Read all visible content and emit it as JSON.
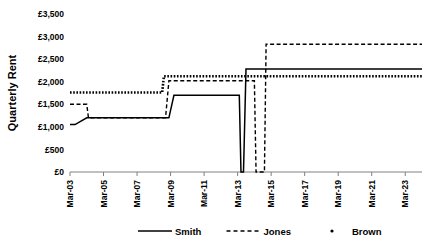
{
  "chart_data": {
    "type": "line",
    "title": "",
    "xlabel": "",
    "ylabel": "Quarterly Rent",
    "ylim": [
      0,
      3500
    ],
    "ytick_values": [
      0,
      500,
      1000,
      1500,
      2000,
      2500,
      3000,
      3500
    ],
    "ytick_labels": [
      "£0",
      "£500",
      "£1,000",
      "£1,500",
      "£2,000",
      "£2,500",
      "£3,000",
      "£3,500"
    ],
    "xlim": [
      2003,
      2024
    ],
    "xtick_values": [
      2003,
      2005,
      2007,
      2009,
      2011,
      2013,
      2015,
      2017,
      2019,
      2021,
      2023
    ],
    "xtick_labels": [
      "Mar-03",
      "Mar-05",
      "Mar-07",
      "Mar-09",
      "Mar-11",
      "Mar-13",
      "Mar-15",
      "Mar-17",
      "Mar-19",
      "Mar-21",
      "Mar-23"
    ],
    "grid": false,
    "legend_position": "bottom",
    "series": [
      {
        "name": "Smith",
        "style": "solid",
        "color": "#000000",
        "x": [
          2003.0,
          2003.3,
          2004.0,
          2008.9,
          2009.2,
          2013.1,
          2013.2,
          2013.35,
          2013.5,
          2024.0
        ],
        "values": [
          1050,
          1050,
          1200,
          1200,
          1700,
          1700,
          0,
          0,
          2280,
          2280
        ]
      },
      {
        "name": "Jones",
        "style": "dashed",
        "color": "#000000",
        "x": [
          2003.0,
          2004.0,
          2004.1,
          2008.7,
          2008.9,
          2014.0,
          2014.1,
          2014.6,
          2014.7,
          2024.0
        ],
        "values": [
          1500,
          1500,
          1200,
          1200,
          2020,
          2020,
          0,
          0,
          2830,
          2830
        ]
      },
      {
        "name": "Brown",
        "style": "dotted",
        "color": "#000000",
        "x": [
          2003.0,
          2008.5,
          2008.6,
          2024.0
        ],
        "values": [
          1760,
          1760,
          2120,
          2120
        ]
      }
    ],
    "legend_entries": [
      {
        "label": "Smith",
        "style": "solid"
      },
      {
        "label": "Jones",
        "style": "dashed"
      },
      {
        "label": "Brown",
        "style": "dotted"
      }
    ]
  }
}
